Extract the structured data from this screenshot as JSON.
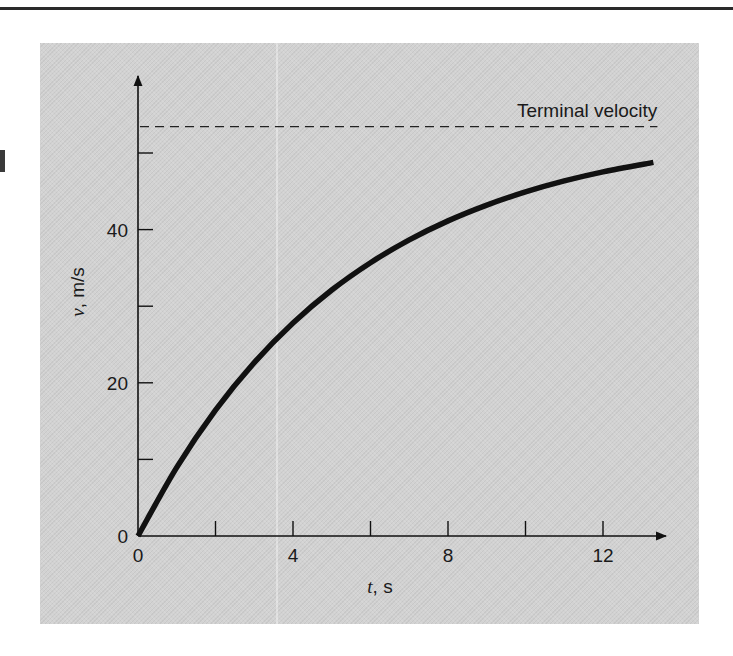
{
  "chart_data": {
    "type": "line",
    "title": "",
    "xlabel": "t, s",
    "xlabel_var": "t",
    "xlabel_unit": ", s",
    "ylabel": "v, m/s",
    "ylabel_var": "v",
    "ylabel_unit": ", m/s",
    "xlim": [
      0,
      13.5
    ],
    "ylim": [
      0,
      60
    ],
    "x_ticks": [
      0,
      2,
      4,
      6,
      8,
      10,
      12
    ],
    "x_tick_labels": [
      "0",
      "",
      "4",
      "",
      "8",
      "",
      "12"
    ],
    "y_ticks": [
      0,
      10,
      20,
      30,
      40,
      50
    ],
    "y_tick_labels": [
      "0",
      "",
      "20",
      "",
      "40",
      ""
    ],
    "grid": false,
    "legend": null,
    "series": [
      {
        "name": "velocity",
        "style": "solid-thick",
        "color": "#111111",
        "x": [
          0,
          1,
          2,
          3,
          4,
          5,
          6,
          7,
          8,
          9,
          10,
          11,
          12,
          13.3
        ],
        "values": [
          0,
          8.96,
          16.42,
          22.63,
          27.8,
          32.11,
          35.68,
          38.66,
          41.14,
          43.2,
          44.92,
          46.35,
          47.54,
          48.78
        ]
      },
      {
        "name": "Terminal velocity",
        "style": "dashed",
        "color": "#222222",
        "x": [
          0,
          13.3
        ],
        "values": [
          53.44,
          53.44
        ]
      }
    ],
    "annotations": [
      {
        "text": "Terminal velocity",
        "x": 13.3,
        "y": 53.44,
        "anchor": "end",
        "position": "above"
      }
    ]
  },
  "colors": {
    "panel_background": "#d2d2d2",
    "ink": "#111111",
    "page": "#ffffff"
  }
}
